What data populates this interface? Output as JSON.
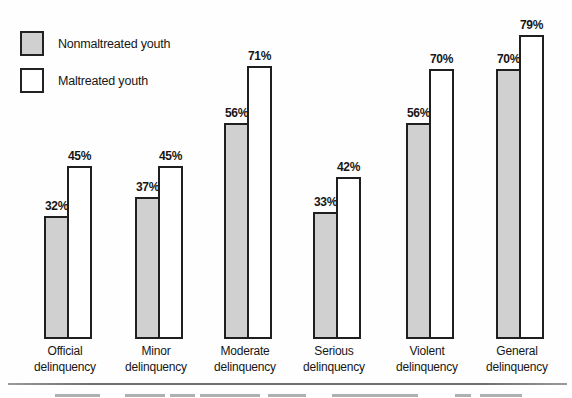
{
  "legend": {
    "items": [
      {
        "label": "Nonmaltreated youth",
        "swatch": "#d0d0d0"
      },
      {
        "label": "Maltreated youth",
        "swatch": "#ffffff"
      }
    ]
  },
  "chart_data": {
    "type": "bar",
    "title": "",
    "categories": [
      "Official delinquency",
      "Minor delinquency",
      "Moderate delinquency",
      "Serious delinquency",
      "Violent delinquency",
      "General delinquency"
    ],
    "category_lines": [
      [
        "Official",
        "delinquency"
      ],
      [
        "Minor",
        "delinquency"
      ],
      [
        "Moderate",
        "delinquency"
      ],
      [
        "Serious",
        "delinquency"
      ],
      [
        "Violent",
        "delinquency"
      ],
      [
        "General",
        "delinquency"
      ]
    ],
    "series": [
      {
        "name": "Nonmaltreated youth",
        "color": "#d0d0d0",
        "values": [
          32,
          37,
          56,
          33,
          56,
          70
        ]
      },
      {
        "name": "Maltreated youth",
        "color": "#ffffff",
        "values": [
          45,
          45,
          71,
          42,
          70,
          79
        ]
      }
    ],
    "value_suffix": "%",
    "data_labels": [
      "32%",
      "45%",
      "37%",
      "45%",
      "56%",
      "71%",
      "33%",
      "42%",
      "56%",
      "70%",
      "70%",
      "79%"
    ],
    "xlabel": "",
    "ylabel": "",
    "ylim": [
      0,
      100
    ],
    "grid": false,
    "axes_visible": false,
    "legend_position": "top-left",
    "bar_border_color": "#1f1f1f",
    "text_color": "#161616"
  }
}
